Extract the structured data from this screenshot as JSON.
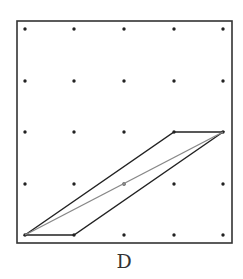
{
  "diagram": {
    "label": "D",
    "grid": {
      "cols": 5,
      "rows": 5,
      "x": [
        25,
        74,
        124,
        174,
        223
      ],
      "y": [
        29,
        81,
        132,
        184,
        235
      ]
    },
    "frame": {
      "x": 17,
      "y": 21,
      "width": 215,
      "height": 222
    },
    "parallelogram": {
      "vertices": [
        [
          0,
          4
        ],
        [
          1,
          4
        ],
        [
          4,
          2
        ],
        [
          3,
          2
        ]
      ],
      "stroke": "#222222"
    },
    "diagonal": {
      "from": [
        0,
        4
      ],
      "to": [
        4,
        2
      ],
      "midpoint": [
        2,
        3
      ],
      "stroke": "#888888"
    },
    "colors": {
      "frame": "#333333",
      "dot": "#222222",
      "background": "#ffffff"
    }
  }
}
